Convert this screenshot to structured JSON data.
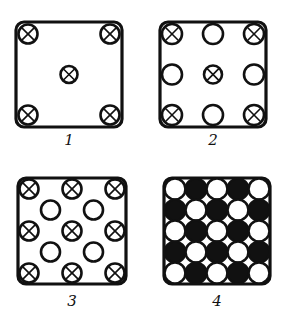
{
  "figure": {
    "legend": {
      "crossed_circle": "circle with an X mark",
      "open_circle": "plain open circle",
      "filled_circle": "solid black circle"
    },
    "panels": [
      {
        "label": "1",
        "grid": [
          [
            "X",
            ".",
            "X"
          ],
          [
            ".",
            "X",
            "."
          ],
          [
            "X",
            ".",
            "X"
          ]
        ]
      },
      {
        "label": "2",
        "grid": [
          [
            "X",
            "O",
            "X"
          ],
          [
            "O",
            "X",
            "O"
          ],
          [
            "X",
            "O",
            "X"
          ]
        ]
      },
      {
        "label": "3",
        "grid": [
          [
            "X",
            ".",
            "X",
            ".",
            "X"
          ],
          [
            ".",
            "O",
            ".",
            "O",
            "."
          ],
          [
            "X",
            ".",
            "X",
            ".",
            "X"
          ],
          [
            ".",
            "O",
            ".",
            "O",
            "."
          ],
          [
            "X",
            ".",
            "X",
            ".",
            "X"
          ]
        ]
      },
      {
        "label": "4",
        "grid": [
          [
            "O",
            "B",
            "O",
            "B",
            "O"
          ],
          [
            "B",
            "O",
            "B",
            "O",
            "B"
          ],
          [
            "O",
            "B",
            "O",
            "B",
            "O"
          ],
          [
            "B",
            "O",
            "B",
            "O",
            "B"
          ],
          [
            "O",
            "B",
            "O",
            "B",
            "O"
          ]
        ]
      }
    ]
  }
}
